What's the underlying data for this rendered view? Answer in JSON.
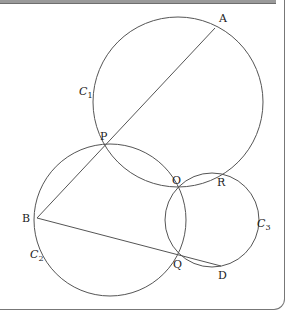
{
  "diagram": {
    "stroke_color": "#555555",
    "points": {
      "A": {
        "label": "A",
        "x": 215,
        "y": 28
      },
      "P": {
        "label": "P",
        "x": 106,
        "y": 144
      },
      "O": {
        "label": "O",
        "x": 177,
        "y": 188
      },
      "R": {
        "label": "R",
        "x": 218,
        "y": 172
      },
      "B": {
        "label": "B",
        "x": 37,
        "y": 218
      },
      "Q": {
        "label": "Q",
        "x": 177,
        "y": 253
      },
      "D": {
        "label": "D",
        "x": 221,
        "y": 266
      }
    },
    "circles": {
      "C1": {
        "label_main": "C",
        "label_sub": "1",
        "cx": 178,
        "cy": 102,
        "r": 85
      },
      "C2": {
        "label_main": "C",
        "label_sub": "2",
        "cx": 110,
        "cy": 220,
        "r": 76
      },
      "C3": {
        "label_main": "C",
        "label_sub": "3",
        "cx": 212,
        "cy": 220,
        "r": 47
      }
    },
    "segments": [
      {
        "from": "A",
        "to": "B"
      },
      {
        "from": "B",
        "to": "D"
      }
    ]
  }
}
